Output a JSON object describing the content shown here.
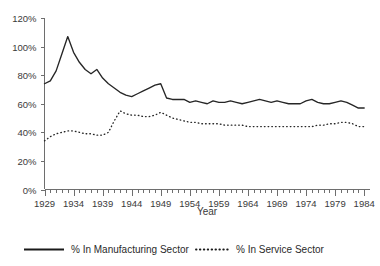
{
  "chart_data": {
    "type": "line",
    "title": "",
    "xlabel": "Year",
    "ylabel": "",
    "xlim": [
      1929,
      1985
    ],
    "ylim": [
      0,
      120
    ],
    "grid": false,
    "legend_position": "bottom",
    "y_ticks": [
      "0%",
      "20%",
      "40%",
      "60%",
      "80%",
      "100%",
      "120%"
    ],
    "y_tick_values": [
      0,
      20,
      40,
      60,
      80,
      100,
      120
    ],
    "x_tick_labels": [
      "1929",
      "1934",
      "1939",
      "1944",
      "1949",
      "1954",
      "1959",
      "1964",
      "1969",
      "1974",
      "1979",
      "1984"
    ],
    "x_tick_values": [
      1929,
      1934,
      1939,
      1944,
      1949,
      1954,
      1959,
      1964,
      1969,
      1974,
      1979,
      1984
    ],
    "x_minor_step": 1,
    "x": [
      1929,
      1930,
      1931,
      1932,
      1933,
      1934,
      1935,
      1936,
      1937,
      1938,
      1939,
      1940,
      1941,
      1942,
      1943,
      1944,
      1945,
      1946,
      1947,
      1948,
      1949,
      1950,
      1951,
      1952,
      1953,
      1954,
      1955,
      1956,
      1957,
      1958,
      1959,
      1960,
      1961,
      1962,
      1963,
      1964,
      1965,
      1966,
      1967,
      1968,
      1969,
      1970,
      1971,
      1972,
      1973,
      1974,
      1975,
      1976,
      1977,
      1978,
      1979,
      1980,
      1981,
      1982,
      1983,
      1984
    ],
    "series": [
      {
        "name": "% In Manufacturing Sector",
        "style": "solid",
        "color": "#262626",
        "values": [
          74,
          76,
          83,
          95,
          107,
          96,
          89,
          84,
          81,
          84,
          78,
          74,
          71,
          68,
          66,
          65,
          67,
          69,
          71,
          73,
          74,
          64,
          63,
          63,
          63,
          61,
          62,
          61,
          60,
          62,
          61,
          61,
          62,
          61,
          60,
          61,
          62,
          63,
          62,
          61,
          62,
          61,
          60,
          60,
          60,
          62,
          63,
          61,
          60,
          60,
          61,
          62,
          61,
          59,
          57,
          57
        ]
      },
      {
        "name": "% In Service Sector",
        "style": "dotted",
        "color": "#262626",
        "values": [
          34,
          37,
          39,
          40,
          41,
          41,
          40,
          39,
          39,
          38,
          38,
          40,
          48,
          55,
          53,
          52,
          52,
          51,
          51,
          52,
          54,
          52,
          50,
          49,
          48,
          47,
          47,
          46,
          46,
          46,
          46,
          45,
          45,
          45,
          45,
          44,
          44,
          44,
          44,
          44,
          44,
          44,
          44,
          44,
          44,
          44,
          44,
          45,
          45,
          46,
          46,
          47,
          47,
          46,
          44,
          44
        ]
      }
    ]
  },
  "legend": {
    "items": [
      {
        "label": "% In Manufacturing Sector",
        "style": "solid"
      },
      {
        "label": "% In Service Sector",
        "style": "dotted"
      }
    ]
  }
}
